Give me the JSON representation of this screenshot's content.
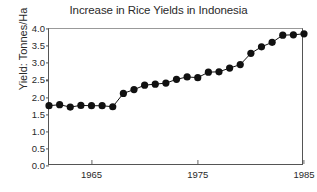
{
  "chart_data": {
    "type": "line",
    "title": "Increase in Rice Yields in Indonesia",
    "xlabel": "",
    "ylabel": "Yield: Tonnes/Ha",
    "xlim": [
      1961,
      1985
    ],
    "ylim": [
      0.0,
      4.0
    ],
    "grid": false,
    "legend": "none",
    "marker": "filled-circle",
    "x_tick_labels": [
      "1965",
      "1975",
      "1985"
    ],
    "x_tick_values": [
      1965,
      1975,
      1985
    ],
    "y_tick_labels": [
      "0.0",
      "0.5",
      "1.0",
      "1.5",
      "2.0",
      "2.5",
      "3.0",
      "3.5",
      "4.0"
    ],
    "y_tick_values": [
      0.0,
      0.5,
      1.0,
      1.5,
      2.0,
      2.5,
      3.0,
      3.5,
      4.0
    ],
    "x": [
      1961,
      1962,
      1963,
      1964,
      1965,
      1966,
      1967,
      1968,
      1969,
      1970,
      1971,
      1972,
      1973,
      1974,
      1975,
      1976,
      1977,
      1978,
      1979,
      1980,
      1981,
      1982,
      1983,
      1984,
      1985
    ],
    "values": [
      1.76,
      1.79,
      1.72,
      1.77,
      1.76,
      1.76,
      1.73,
      2.12,
      2.23,
      2.36,
      2.39,
      2.42,
      2.53,
      2.6,
      2.58,
      2.74,
      2.75,
      2.86,
      2.96,
      3.29,
      3.48,
      3.61,
      3.82,
      3.83,
      3.86
    ],
    "series": [
      {
        "name": "Rice yield",
        "color": "#111111",
        "values": [
          1.76,
          1.79,
          1.72,
          1.77,
          1.76,
          1.76,
          1.73,
          2.12,
          2.23,
          2.36,
          2.39,
          2.42,
          2.53,
          2.6,
          2.58,
          2.74,
          2.75,
          2.86,
          2.96,
          3.29,
          3.48,
          3.61,
          3.82,
          3.83,
          3.86
        ]
      }
    ]
  },
  "style": {
    "marker_color": "#111111",
    "line_color": "#333333",
    "axis_color": "#555555",
    "background": "#ffffff"
  }
}
